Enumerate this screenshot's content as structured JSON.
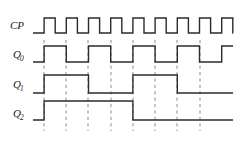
{
  "diagram": {
    "type": "timing-diagram",
    "background_color": "#ffffff",
    "wave_color": "#2b2b2b",
    "grid_color": "#8d8d8d",
    "label_color": "#1a1a1a",
    "width": 239,
    "height": 142,
    "geometry": {
      "x_start": 33,
      "x_end": 233,
      "half_period": 11.1,
      "cp_high_y": 18,
      "cp_low_y": 33,
      "q0_high_y": 46,
      "q0_low_y": 62,
      "q1_high_y": 75,
      "q1_low_y": 93,
      "q2_high_y": 101,
      "q2_low_y": 120,
      "grid_top": 40,
      "grid_bottom": 131
    },
    "signals": [
      {
        "name": "CP",
        "label": "CP",
        "subscript": "",
        "label_x": 10,
        "label_y": 29,
        "row": 0,
        "description": "clock pulse, 9 pulses",
        "pulse_count": 9,
        "initial_level": 0,
        "pattern": [
          0,
          1,
          0,
          1,
          0,
          1,
          0,
          1,
          0,
          1,
          0,
          1,
          0,
          1,
          0,
          1,
          0,
          1,
          0
        ]
      },
      {
        "name": "Q0",
        "label": "Q",
        "subscript": "0",
        "label_x": 10,
        "label_y": 58,
        "row": 1,
        "description": "LSB, toggles every clock pulse",
        "pulse_count": 4,
        "initial_level": 0,
        "pattern": [
          0,
          1,
          1,
          0,
          0,
          1,
          1,
          0,
          0,
          1,
          1,
          0,
          0,
          1,
          1,
          0,
          0,
          1,
          1
        ]
      },
      {
        "name": "Q1",
        "label": "Q",
        "subscript": "1",
        "label_x": 10,
        "label_y": 88,
        "row": 2,
        "description": "middle bit, toggles every two clock pulses",
        "pulse_count": 2,
        "initial_level": 0,
        "pattern": [
          0,
          1,
          1,
          1,
          1,
          0,
          0,
          0,
          0,
          1,
          1,
          1,
          1,
          0,
          0,
          0,
          0,
          0,
          0
        ]
      },
      {
        "name": "Q2",
        "label": "Q",
        "subscript": "2",
        "label_x": 10,
        "label_y": 117,
        "row": 3,
        "description": "MSB, single long pulse",
        "pulse_count": 1,
        "initial_level": 0,
        "pattern": [
          0,
          1,
          1,
          1,
          1,
          1,
          1,
          1,
          1,
          0,
          0,
          0,
          0,
          0,
          0,
          0,
          0,
          0,
          0
        ]
      }
    ],
    "grid_lines": [
      {
        "index": 0,
        "x": 44
      },
      {
        "index": 1,
        "x": 66
      },
      {
        "index": 2,
        "x": 88
      },
      {
        "index": 3,
        "x": 111
      },
      {
        "index": 4,
        "x": 133
      },
      {
        "index": 5,
        "x": 155
      },
      {
        "index": 6,
        "x": 177
      },
      {
        "index": 7,
        "x": 200
      }
    ]
  }
}
